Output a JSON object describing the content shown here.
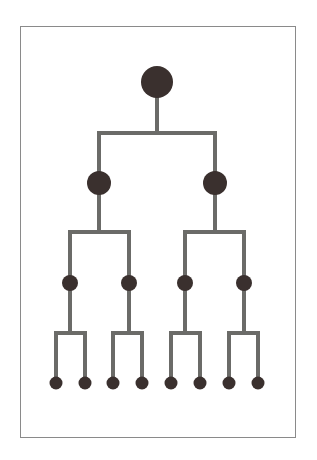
{
  "diagram": {
    "type": "binary-tree",
    "levels": 4,
    "colors": {
      "background": "#ffffff",
      "frame": "#8a8a8a",
      "edge": "#6b6b68",
      "node": "#3a302e"
    },
    "edge_width": 4,
    "nodes": [
      {
        "id": "root",
        "level": 0,
        "x": 157,
        "y": 82,
        "r": 16
      },
      {
        "id": "l1-a",
        "level": 1,
        "x": 99,
        "y": 183,
        "r": 12
      },
      {
        "id": "l1-b",
        "level": 1,
        "x": 215,
        "y": 183,
        "r": 12
      },
      {
        "id": "l2-a",
        "level": 2,
        "x": 70,
        "y": 283,
        "r": 8
      },
      {
        "id": "l2-b",
        "level": 2,
        "x": 129,
        "y": 283,
        "r": 8
      },
      {
        "id": "l2-c",
        "level": 2,
        "x": 185,
        "y": 283,
        "r": 8
      },
      {
        "id": "l2-d",
        "level": 2,
        "x": 244,
        "y": 283,
        "r": 8
      },
      {
        "id": "l3-a",
        "level": 3,
        "x": 56,
        "y": 383,
        "r": 6.5
      },
      {
        "id": "l3-b",
        "level": 3,
        "x": 85,
        "y": 383,
        "r": 6.5
      },
      {
        "id": "l3-c",
        "level": 3,
        "x": 113,
        "y": 383,
        "r": 6.5
      },
      {
        "id": "l3-d",
        "level": 3,
        "x": 142,
        "y": 383,
        "r": 6.5
      },
      {
        "id": "l3-e",
        "level": 3,
        "x": 171,
        "y": 383,
        "r": 6.5
      },
      {
        "id": "l3-f",
        "level": 3,
        "x": 200,
        "y": 383,
        "r": 6.5
      },
      {
        "id": "l3-g",
        "level": 3,
        "x": 229,
        "y": 383,
        "r": 6.5
      },
      {
        "id": "l3-h",
        "level": 3,
        "x": 258,
        "y": 383,
        "r": 6.5
      }
    ],
    "branches": [
      {
        "parent": "root",
        "children": [
          "l1-a",
          "l1-b"
        ],
        "bar_y": 133
      },
      {
        "parent": "l1-a",
        "children": [
          "l2-a",
          "l2-b"
        ],
        "bar_y": 232
      },
      {
        "parent": "l1-b",
        "children": [
          "l2-c",
          "l2-d"
        ],
        "bar_y": 232
      },
      {
        "parent": "l2-a",
        "children": [
          "l3-a",
          "l3-b"
        ],
        "bar_y": 333
      },
      {
        "parent": "l2-b",
        "children": [
          "l3-c",
          "l3-d"
        ],
        "bar_y": 333
      },
      {
        "parent": "l2-c",
        "children": [
          "l3-e",
          "l3-f"
        ],
        "bar_y": 333
      },
      {
        "parent": "l2-d",
        "children": [
          "l3-g",
          "l3-h"
        ],
        "bar_y": 333
      }
    ]
  }
}
